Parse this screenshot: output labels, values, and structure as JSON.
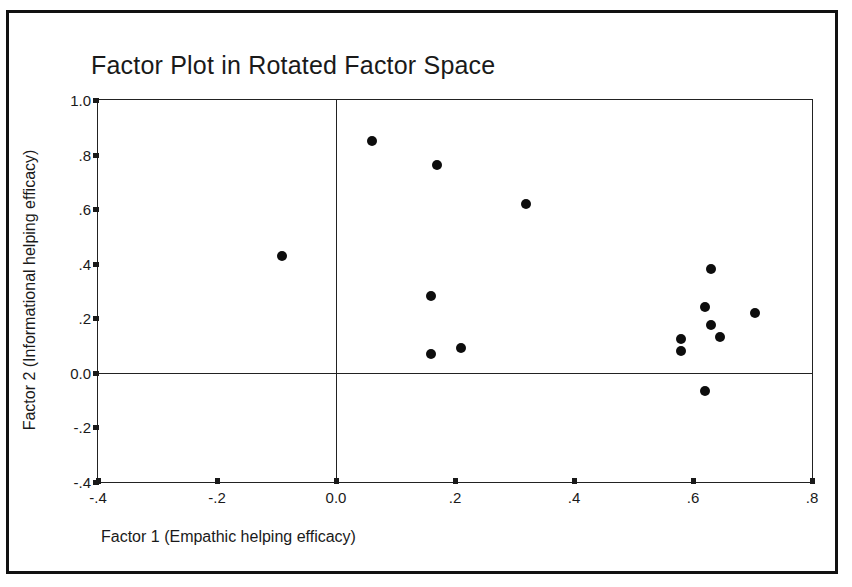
{
  "chart_data": {
    "type": "scatter",
    "title": "Factor Plot in Rotated Factor Space",
    "xlabel": "Factor 1 (Empathic helping efficacy)",
    "ylabel": "Factor 2 (Informational helping efficacy)",
    "xlim": [
      -0.4,
      0.8
    ],
    "ylim": [
      -0.4,
      1.0
    ],
    "grid": false,
    "legend": "none",
    "reference_lines": {
      "vertical_x": 0.0,
      "horizontal_y": 0.0
    },
    "xticks": [
      -0.4,
      -0.2,
      0.0,
      0.2,
      0.4,
      0.6,
      0.8
    ],
    "xticklabels": [
      "-.4",
      "-.2",
      "0.0",
      ".2",
      ".4",
      ".6",
      ".8"
    ],
    "yticks": [
      1.0,
      0.8,
      0.6,
      0.4,
      0.2,
      0.0,
      -0.2,
      -0.4
    ],
    "yticklabels": [
      "1.0",
      ".8",
      ".6",
      ".4",
      ".2",
      "0.0",
      "-.2",
      "-.4"
    ],
    "marker": "filled-circle",
    "marker_color": "#0d0d0d",
    "n_points": 15,
    "points": [
      {
        "x": 0.06,
        "y": 0.85
      },
      {
        "x": 0.17,
        "y": 0.76
      },
      {
        "x": 0.32,
        "y": 0.62
      },
      {
        "x": -0.09,
        "y": 0.43
      },
      {
        "x": 0.16,
        "y": 0.28
      },
      {
        "x": 0.16,
        "y": 0.07
      },
      {
        "x": 0.21,
        "y": 0.09
      },
      {
        "x": 0.63,
        "y": 0.38
      },
      {
        "x": 0.62,
        "y": 0.24
      },
      {
        "x": 0.63,
        "y": 0.175
      },
      {
        "x": 0.58,
        "y": 0.125
      },
      {
        "x": 0.58,
        "y": 0.08
      },
      {
        "x": 0.645,
        "y": 0.13
      },
      {
        "x": 0.705,
        "y": 0.22
      },
      {
        "x": 0.62,
        "y": -0.065
      }
    ]
  }
}
